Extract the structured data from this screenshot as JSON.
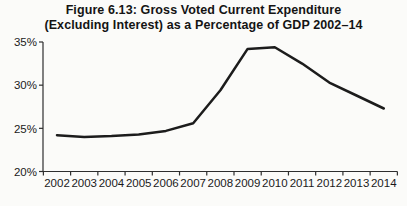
{
  "chart_data": {
    "type": "line",
    "title": "Figure 6.13: Gross Voted Current Expenditure (Excluding Interest) as a Percentage of GDP 2002–14",
    "title_lines": [
      "Figure 6.13: Gross Voted Current Expenditure",
      "(Excluding Interest) as a Percentage of GDP 2002–14"
    ],
    "categories": [
      "2002",
      "2003",
      "2004",
      "2005",
      "2006",
      "2007",
      "2008",
      "2009",
      "2010",
      "2011",
      "2012",
      "2013",
      "2014"
    ],
    "values": [
      24.2,
      24.0,
      24.1,
      24.3,
      24.7,
      25.6,
      29.4,
      34.2,
      34.4,
      32.5,
      30.3,
      28.8,
      27.3
    ],
    "ylim": [
      20,
      35
    ],
    "ytick_step": 5,
    "ytick_labels": [
      "20%",
      "25%",
      "30%",
      "35%"
    ],
    "xlabel": "",
    "ylabel": "",
    "grid": "off",
    "legend": "none",
    "colors": {
      "line": "#1c1c1c",
      "axis": "#2e2e2e",
      "tick_text": "#1a1a1a",
      "background": "#fbfbf9"
    }
  }
}
